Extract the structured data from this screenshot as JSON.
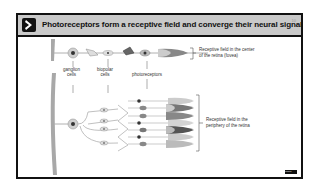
{
  "slide": {
    "title": "Photoreceptors form a receptive field and converge their neural signal",
    "page_number": "10",
    "header_color": "#c9c9c9",
    "footer_tag": "mediva"
  },
  "diagram": {
    "labels": {
      "ganglion": "ganglion cells",
      "ganglion_line1": "ganglion",
      "ganglion_line2": "cells",
      "bipolar": "bipolar cells",
      "bipolar_line1": "biopolar",
      "bipolar_line2": "cells",
      "photoreceptors": "photoreceptors"
    },
    "receptive_fields": [
      {
        "line1": "Receptive field in the center",
        "line2": "of the retina (fovea)"
      },
      {
        "line1": "Receptive field in the",
        "line2": "periphery of the retina"
      }
    ]
  }
}
